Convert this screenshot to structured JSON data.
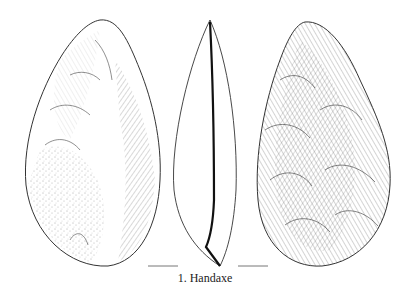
{
  "figure": {
    "caption": "1. Handaxe",
    "views": [
      {
        "name": "face-a",
        "description": "Handaxe dorsal face with flake scars and stippled cortex"
      },
      {
        "name": "profile",
        "description": "Handaxe lateral profile outline"
      },
      {
        "name": "face-b",
        "description": "Handaxe ventral face with flake scars"
      }
    ],
    "scale_bars": 2,
    "colors": {
      "background": "#ffffff",
      "ink": "#222222"
    }
  }
}
